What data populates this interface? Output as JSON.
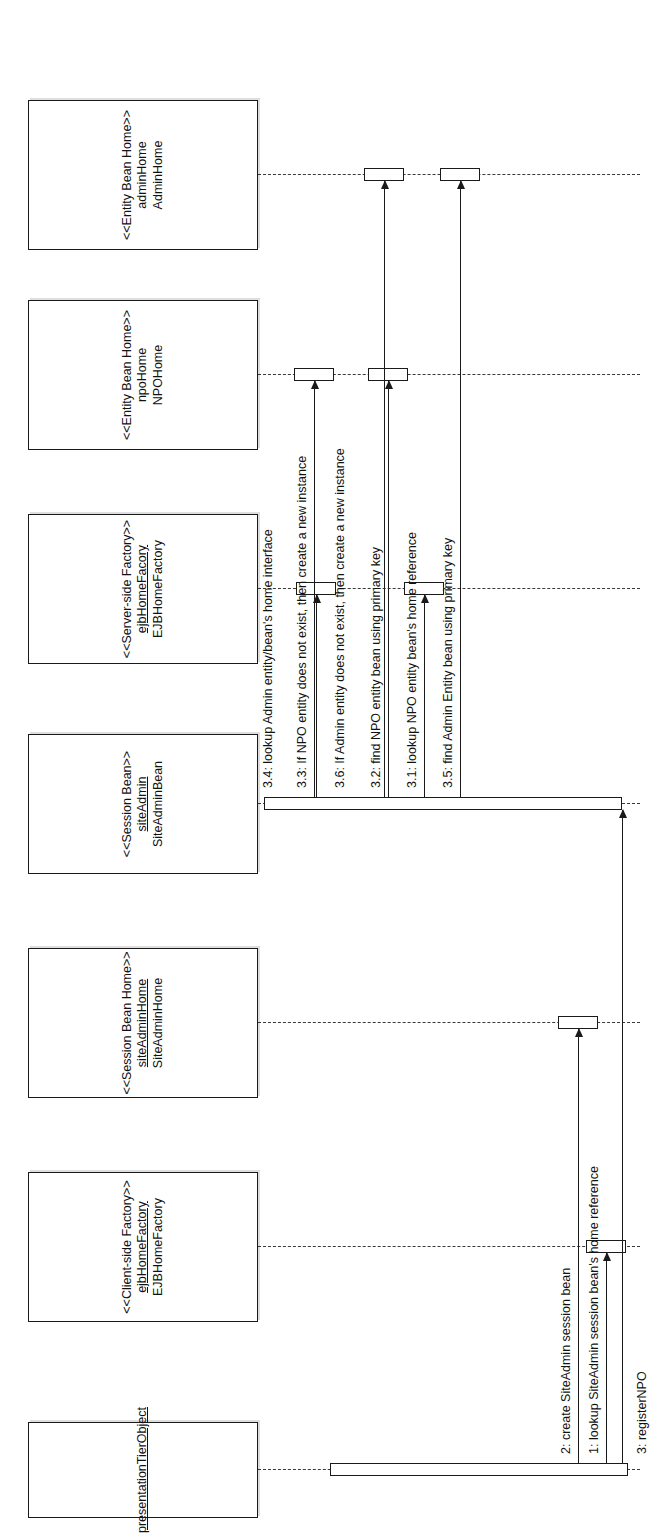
{
  "diagram": {
    "type": "uml-sequence-diagram",
    "title": "",
    "orientation": "rotated-90-ccw",
    "line_color": "#1a1a1a",
    "background": "#ffffff"
  },
  "lifelines": [
    {
      "id": "presentation",
      "stereotype": "",
      "instance": "presentationTierObject",
      "class": "",
      "single_line": true
    },
    {
      "id": "clientFactory",
      "stereotype": "<<Client-side Factory>>",
      "instance": "ejbHomeFactory",
      "class": "EJBHomeFactory",
      "single_line": false
    },
    {
      "id": "sessionHome",
      "stereotype": "<<Session Bean Home>>",
      "instance": "siteAdminHome",
      "class": "SiteAdminHome",
      "single_line": false
    },
    {
      "id": "sessionBean",
      "stereotype": "<<Session Bean>>",
      "instance": "siteAdmin",
      "class": "SiteAdminBean",
      "single_line": false
    },
    {
      "id": "serverFactory",
      "stereotype": "<<Server-side Factory>>",
      "instance": "ejbHomeFacory",
      "class": "EJBHomeFactory",
      "single_line": false
    },
    {
      "id": "npoHome",
      "stereotype": "<<Entity Bean Home>>",
      "instance": "npoHome",
      "class": "NPOHome",
      "single_line": false
    },
    {
      "id": "adminHome",
      "stereotype": "<<Entity Bean Home>>",
      "instance": "adminHome",
      "class": "AdminHome",
      "single_line": false
    }
  ],
  "messages": [
    {
      "seq": "1",
      "label": "1: lookup SiteAdmin session bean's home reference",
      "from": "presentation",
      "to": "clientFactory"
    },
    {
      "seq": "2",
      "label": "2: create SiteAdmin session bean",
      "from": "presentation",
      "to": "sessionHome"
    },
    {
      "seq": "3",
      "label": "3: registerNPO",
      "from": "presentation",
      "to": "sessionBean"
    },
    {
      "seq": "3.1",
      "label": "3.1: lookup NPO entity bean's home reference",
      "from": "sessionBean",
      "to": "serverFactory"
    },
    {
      "seq": "3.2",
      "label": "3.2: find NPO entity bean using primary key",
      "from": "sessionBean",
      "to": "npoHome"
    },
    {
      "seq": "3.3",
      "label": "3.3: If NPO entity does not exist, then create a new instance",
      "from": "sessionBean",
      "to": "npoHome"
    },
    {
      "seq": "3.4",
      "label": "3.4: lookup Admin entity/bean's home interface",
      "from": "sessionBean",
      "to": "serverFactory"
    },
    {
      "seq": "3.5",
      "label": "3.5: find Admin Entity bean using primary key",
      "from": "sessionBean",
      "to": "adminHome"
    },
    {
      "seq": "3.6",
      "label": "3.6: If Admin entity does not exist, then create a new instance",
      "from": "sessionBean",
      "to": "adminHome"
    }
  ]
}
